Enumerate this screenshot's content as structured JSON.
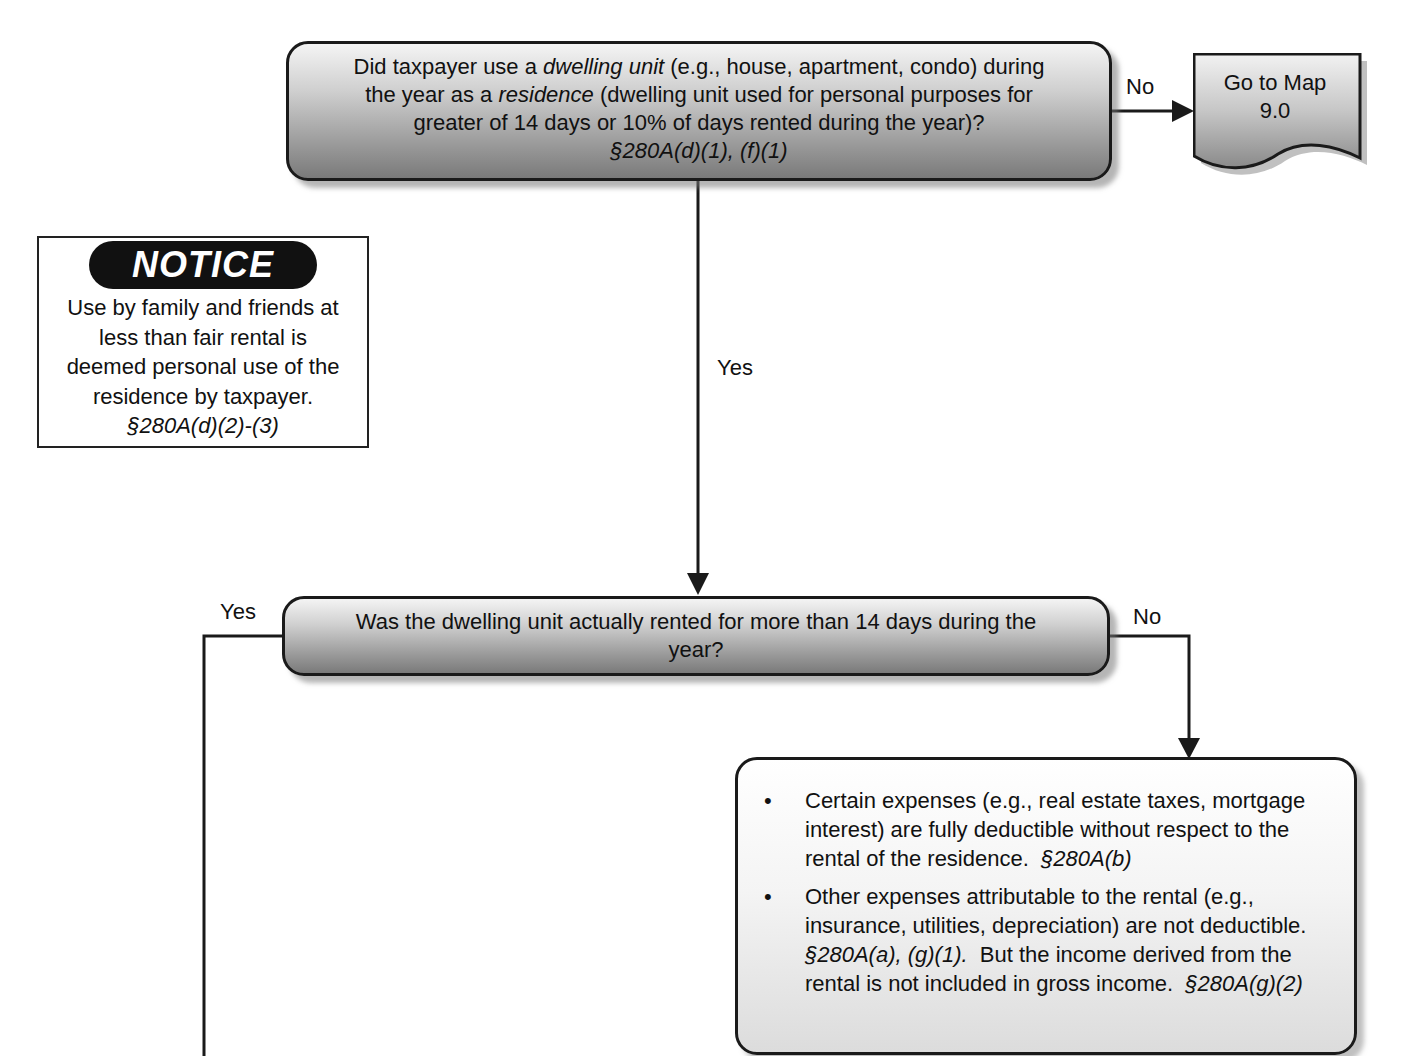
{
  "decision1": {
    "lines": [
      [
        "Did taxpayer use a ",
        "dwelling unit",
        " (e.g., house, apartment, condo) during"
      ],
      [
        "the year as a ",
        "residence",
        " (dwelling unit used for personal purposes for"
      ],
      [
        "greater of 14 days or 10% of days rented during the year)?"
      ]
    ],
    "citation": "§280A(d)(1), (f)(1)",
    "no_label": "No",
    "yes_label": "Yes"
  },
  "offpage": {
    "line1": "Go to Map",
    "line2": "9.0"
  },
  "notice": {
    "title": "NOTICE",
    "lines": [
      "Use by family and friends at",
      "less than fair rental is",
      "deemed personal use of the",
      "residence by taxpayer."
    ],
    "citation": "§280A(d)(2)-(3)"
  },
  "decision2": {
    "line1": "Was the dwelling unit actually rented for more than 14 days during the",
    "line2": "year?",
    "yes_label": "Yes",
    "no_label": "No"
  },
  "result": {
    "items": [
      {
        "text": "Certain expenses (e.g., real estate taxes, mortgage interest) are fully deductible without respect to the rental of the residence.",
        "citation": "§280A(b)"
      },
      {
        "text_a": "Other expenses attributable to the rental (e.g., insurance, utilities, depreciation) are not deductible.",
        "citation_a": "§280A(a), (g)(1).",
        "text_b": "But the income derived from the rental is not included in gross income.",
        "citation_b": "§280A(g)(2)"
      }
    ],
    "bullet": "•"
  },
  "colors": {
    "line": "#1a1a1a",
    "box_dark": "#7a7a7a",
    "box_light": "#f4f4f4",
    "notice_pill": "#111111"
  }
}
